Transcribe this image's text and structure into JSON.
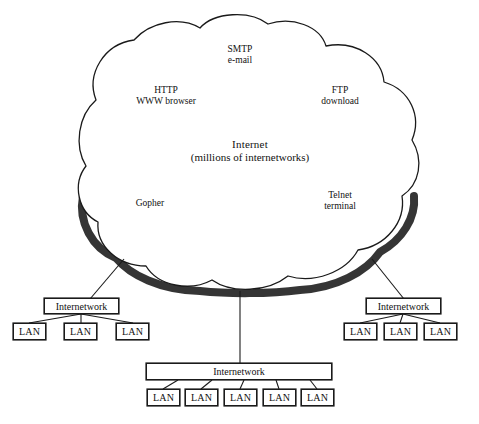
{
  "diagram": {
    "cloud": {
      "center_label": {
        "line1": "Internet",
        "line2": "(millions of internetworks)"
      },
      "services": [
        {
          "name": "smtp",
          "line1": "SMTP",
          "line2": "e-mail"
        },
        {
          "name": "http",
          "line1": "HTTP",
          "line2": "WWW browser"
        },
        {
          "name": "ftp",
          "line1": "FTP",
          "line2": "download"
        },
        {
          "name": "gopher",
          "line1": "Gopher",
          "line2": ""
        },
        {
          "name": "telnet",
          "line1": "Telnet",
          "line2": "terminal"
        }
      ]
    },
    "clusters": [
      {
        "name": "left-cluster",
        "internetwork_label": "Internetwork",
        "lans": [
          "LAN",
          "LAN",
          "LAN"
        ]
      },
      {
        "name": "bottom-cluster",
        "internetwork_label": "Internetwork",
        "lans": [
          "LAN",
          "LAN",
          "LAN",
          "LAN",
          "LAN"
        ]
      },
      {
        "name": "right-cluster",
        "internetwork_label": "Internetwork",
        "lans": [
          "LAN",
          "LAN",
          "LAN"
        ]
      }
    ],
    "colors": {
      "line": "#1a1a1a",
      "shadow": "#262626",
      "background": "#ffffff",
      "text": "#111111"
    }
  }
}
